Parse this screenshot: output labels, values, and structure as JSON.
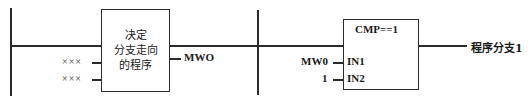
{
  "diagram": {
    "type": "ladder-logic-rung-diagram",
    "title_visible": false,
    "colors": {
      "line": "#2b2b2b",
      "text": "#1a1a1a",
      "background": "#ffffff"
    },
    "rungs": [
      {
        "id": "rung-left",
        "left_rail": true,
        "right_rail": true,
        "block": {
          "name": "decision-block",
          "shape": "rectangle",
          "text_lines": [
            "决定",
            "分支走向",
            "的程序"
          ],
          "inputs": [
            {
              "label": "×××"
            },
            {
              "label": "×××"
            }
          ],
          "outputs": [
            {
              "label": "MWO"
            }
          ]
        }
      },
      {
        "id": "rung-right",
        "left_rail": true,
        "right_rail": false,
        "block": {
          "name": "compare-block",
          "shape": "rectangle",
          "header": "CMP==1",
          "pins": [
            {
              "pin": "IN1",
              "operand": "MW0"
            },
            {
              "pin": "IN2",
              "operand": "1"
            }
          ],
          "outputs": [
            {
              "label": "程序分支1"
            }
          ]
        }
      }
    ]
  }
}
